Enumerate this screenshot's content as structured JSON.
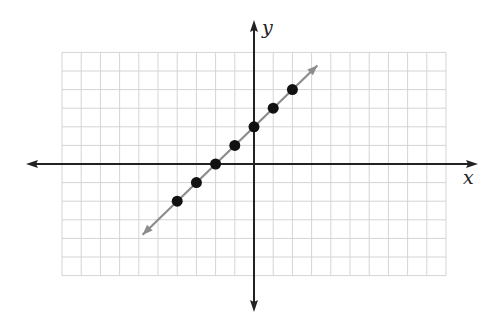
{
  "chart_data": {
    "type": "scatter",
    "title": "",
    "xlabel": "x",
    "ylabel": "y",
    "grid": true,
    "xlim": [
      -10,
      10
    ],
    "ylim": [
      -6,
      6
    ],
    "points": [
      {
        "x": -4,
        "y": -2
      },
      {
        "x": -3,
        "y": -1
      },
      {
        "x": -2,
        "y": 0
      },
      {
        "x": -1,
        "y": 1
      },
      {
        "x": 0,
        "y": 2
      },
      {
        "x": 1,
        "y": 3
      },
      {
        "x": 2,
        "y": 4
      }
    ],
    "line": {
      "equation": "y = x + 2",
      "slope": 1,
      "intercept": 2,
      "from": [
        -5.8,
        -3.8
      ],
      "to": [
        3.3,
        5.3
      ],
      "arrows": "both"
    },
    "colors": {
      "grid": "#d4d4d4",
      "axes": "#222222",
      "line": "#8c8c8c",
      "points": "#111111"
    }
  },
  "labels": {
    "x_axis": "x",
    "y_axis": "y"
  }
}
